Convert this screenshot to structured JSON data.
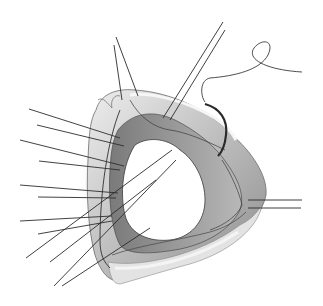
{
  "illustration": {
    "subject": "surgical-view-of-valve-annulus-with-sutures",
    "style": "grayscale pencil drawing",
    "colors": {
      "background": "#ffffff",
      "ink": "#2a2a2a",
      "tissue_light": "#d8d8d8",
      "tissue_mid": "#a9a9a9",
      "tissue_dark": "#5a5a5a",
      "shadow": "#c6c6c6"
    },
    "elements": {
      "left_sutures_count": 9,
      "diagonal_sutures_count": 4,
      "top_sutures_count": 4,
      "right_sutures_count": 2,
      "needle": "curved-needle-with-loop-thread"
    }
  }
}
